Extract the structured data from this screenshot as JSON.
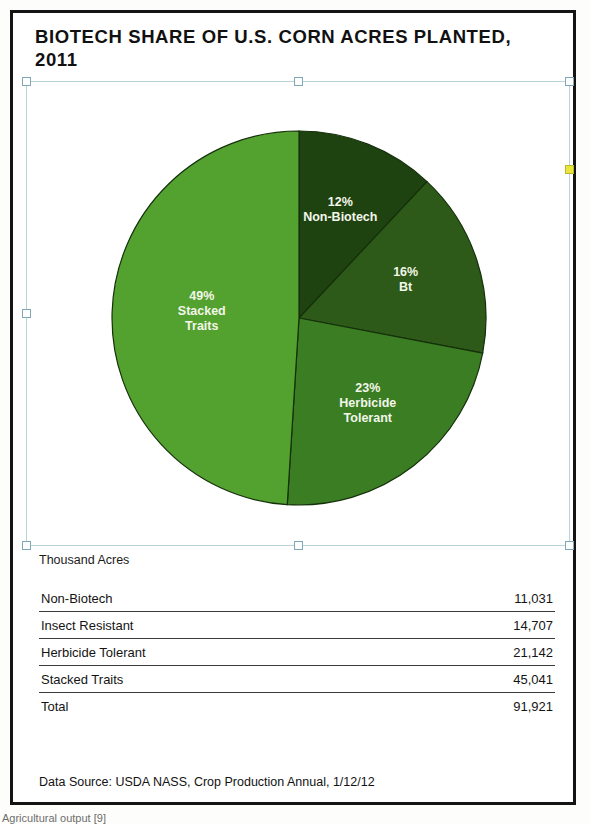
{
  "figure": {
    "title": "BIOTECH SHARE OF U.S. CORN ACRES PLANTED, 2011",
    "table_caption": "Thousand Acres",
    "source_note": "Data Source: USDA NASS, Crop Production Annual, 1/12/12",
    "page_footer_text": "Agricultural output  [9]"
  },
  "selection": {
    "handle_names": [
      "handle-top-left",
      "handle-top-center",
      "handle-top-right",
      "handle-middle-left",
      "handle-middle-right",
      "handle-bottom-left",
      "handle-bottom-center",
      "handle-bottom-right"
    ],
    "active_handle": "handle-middle-right",
    "border_color": "#b9d3da",
    "active_handle_color": "#e9e73c"
  },
  "table": {
    "rows": [
      {
        "label": "Non-Biotech",
        "value": "11,031"
      },
      {
        "label": "Insect Resistant",
        "value": "14,707"
      },
      {
        "label": "Herbicide Tolerant",
        "value": "21,142"
      },
      {
        "label": "Stacked Traits",
        "value": "45,041"
      },
      {
        "label": "Total",
        "value": "91,921"
      }
    ]
  },
  "chart_data": {
    "type": "pie",
    "title": "BIOTECH SHARE OF U.S. CORN ACRES PLANTED, 2011",
    "unit": "Thousand Acres",
    "total": 91921,
    "start_angle_deg": 0,
    "direction": "clockwise",
    "legend": "none (labels drawn inside slices)",
    "categories": [
      "Non-Biotech",
      "Bt",
      "Herbicide Tolerant",
      "Stacked Traits"
    ],
    "values": [
      12,
      16,
      23,
      49
    ],
    "value_unit": "percent",
    "acres_thousands": [
      11031,
      14707,
      21142,
      45041
    ],
    "colors": [
      "#1e4210",
      "#2d5a18",
      "#3a7d22",
      "#53a12e"
    ],
    "slices": [
      {
        "name": "Non-Biotech",
        "percent": 12,
        "label_line1": "12%",
        "label_line2": "Non-Biotech",
        "label_line3": "",
        "color": "#1e4210",
        "acres_thousands": 11031
      },
      {
        "name": "Bt",
        "percent": 16,
        "label_line1": "16%",
        "label_line2": "Bt",
        "label_line3": "",
        "color": "#2d5a18",
        "acres_thousands": 14707
      },
      {
        "name": "Herbicide Tolerant",
        "percent": 23,
        "label_line1": "23%",
        "label_line2": "Herbicide",
        "label_line3": "Tolerant",
        "color": "#3a7d22",
        "acres_thousands": 21142
      },
      {
        "name": "Stacked Traits",
        "percent": 49,
        "label_line1": "49%",
        "label_line2": "Stacked",
        "label_line3": "Traits",
        "color": "#53a12e",
        "acres_thousands": 45041
      }
    ]
  }
}
